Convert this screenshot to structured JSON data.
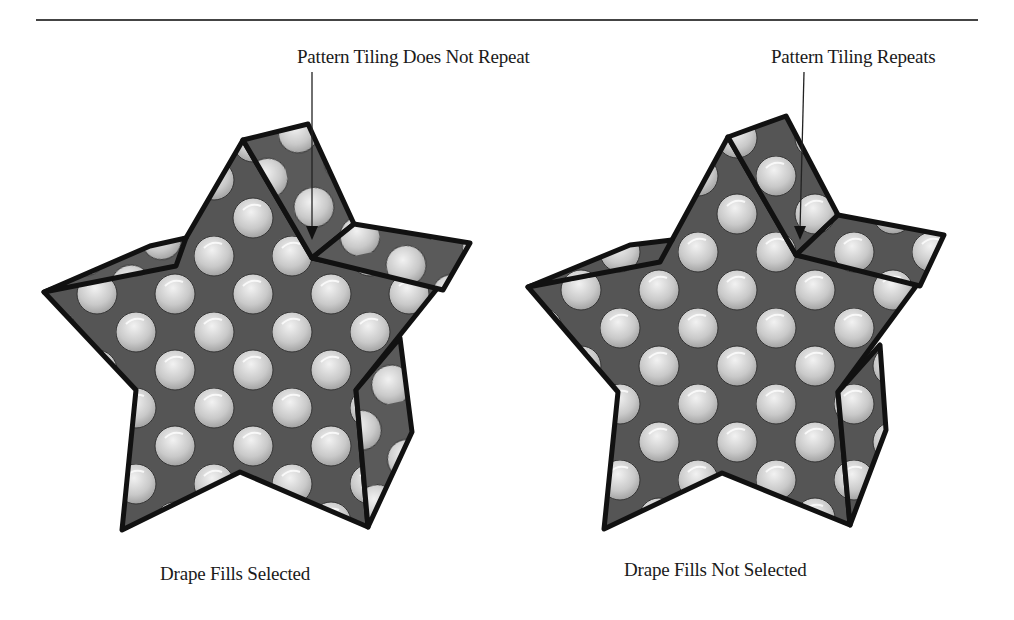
{
  "figure": {
    "callouts": {
      "left": "Pattern Tiling Does Not Repeat",
      "right": "Pattern Tiling Repeats"
    },
    "captions": {
      "left": "Drape Fills Selected",
      "right": "Drape Fills Not Selected"
    },
    "panels": [
      {
        "id": "left",
        "shape": "folded-star",
        "fill": "polka-dot-pattern",
        "drape_fills": true,
        "tiling": "does-not-repeat"
      },
      {
        "id": "right",
        "shape": "folded-star",
        "fill": "polka-dot-pattern",
        "drape_fills": false,
        "tiling": "repeats"
      }
    ],
    "colors": {
      "fill_dark": "#555555",
      "dot_light": "#d8d8d8",
      "dot_shadow": "#8a8a8a",
      "outline": "#111111",
      "rule": "#444444"
    }
  }
}
